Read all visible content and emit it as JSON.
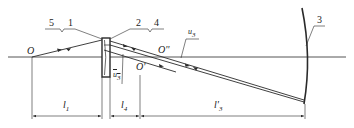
{
  "diagram": {
    "type": "optical-schematic",
    "part_labels": {
      "p1": "1",
      "p2": "2",
      "p3": "3",
      "p4": "4",
      "p5": "5"
    },
    "points": {
      "O": "O",
      "O_prime": "O'",
      "O_double_prime": "O''"
    },
    "angles": {
      "u3": "u",
      "u3_sub": "3",
      "u3_bar": "u",
      "u3_bar_sub": "3"
    },
    "dimensions": {
      "l1": "l",
      "l1_sub": "1",
      "l4": "l",
      "l4_sub": "4",
      "l3p": "l'",
      "l3p_sub": "3"
    },
    "colors": {
      "line": "#2a2a2a",
      "background": "#ffffff"
    }
  }
}
